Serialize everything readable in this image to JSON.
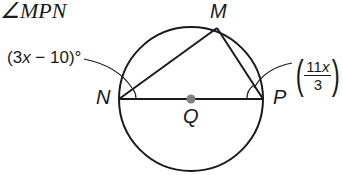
{
  "problem": {
    "title": "∠MPN"
  },
  "diagram": {
    "circle": {
      "center_label": "Q",
      "cx": 191,
      "cy": 99,
      "r": 72
    },
    "points": {
      "M": {
        "label": "M",
        "x": 217,
        "y": 28
      },
      "N": {
        "label": "N",
        "x": 119,
        "y": 99
      },
      "P": {
        "label": "P",
        "x": 263,
        "y": 99
      },
      "Q": {
        "label": "Q",
        "x": 191,
        "y": 99
      }
    },
    "segments": [
      "NM",
      "MP",
      "NP"
    ],
    "angle_labels": {
      "at_N": {
        "text_prefix": "(3",
        "var": "x",
        "text_suffix": " − 10)°"
      },
      "at_P": {
        "numerator_coef": "11",
        "numerator_var": "x",
        "denominator": "3",
        "suffix": "°"
      }
    },
    "colors": {
      "stroke": "#1a1a1a",
      "center_dot": "#808080"
    }
  }
}
